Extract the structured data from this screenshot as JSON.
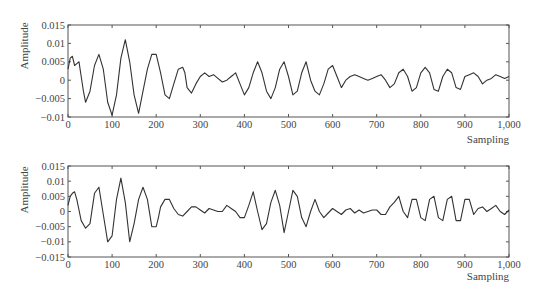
{
  "chart_data": [
    {
      "type": "line",
      "title": "",
      "xlabel": "Sampling",
      "ylabel": "Amplitude",
      "xlim": [
        0,
        1000
      ],
      "ylim": [
        -0.01,
        0.015
      ],
      "xticks": [
        "0",
        "100",
        "200",
        "300",
        "400",
        "500",
        "600",
        "700",
        "800",
        "900",
        "1,000"
      ],
      "yticks": [
        "0.015",
        "0.01",
        "0.005",
        "0",
        "-0.005",
        "-0.01"
      ],
      "grid": false,
      "series": [
        {
          "name": "signal-1",
          "x": [
            0,
            5,
            10,
            15,
            20,
            25,
            30,
            35,
            40,
            50,
            60,
            70,
            80,
            90,
            100,
            110,
            120,
            130,
            140,
            150,
            160,
            170,
            180,
            190,
            200,
            210,
            220,
            230,
            240,
            250,
            260,
            265,
            270,
            280,
            290,
            300,
            310,
            320,
            330,
            340,
            350,
            360,
            370,
            375,
            380,
            390,
            400,
            410,
            420,
            430,
            440,
            450,
            460,
            470,
            480,
            490,
            500,
            510,
            520,
            530,
            540,
            550,
            560,
            570,
            580,
            590,
            600,
            610,
            620,
            630,
            640,
            650,
            660,
            670,
            680,
            690,
            700,
            710,
            720,
            730,
            740,
            750,
            760,
            770,
            780,
            790,
            800,
            810,
            820,
            830,
            840,
            850,
            860,
            870,
            880,
            890,
            900,
            910,
            920,
            930,
            940,
            950,
            960,
            970,
            980,
            990,
            1000
          ],
          "y": [
            0.003,
            0.006,
            0.0065,
            0.004,
            0.0045,
            0.005,
            0.001,
            -0.003,
            -0.006,
            -0.003,
            0.004,
            0.007,
            0.003,
            -0.006,
            -0.0095,
            -0.004,
            0.006,
            0.011,
            0.005,
            -0.004,
            -0.009,
            -0.003,
            0.003,
            0.007,
            0.007,
            0.002,
            -0.004,
            -0.005,
            -0.001,
            0.003,
            0.0035,
            0.002,
            -0.002,
            -0.0035,
            -0.001,
            0.001,
            0.002,
            0.001,
            0.0015,
            0.0005,
            -0.0005,
            0.0,
            0.001,
            0.0015,
            0.002,
            -0.001,
            -0.004,
            -0.002,
            0.002,
            0.005,
            0.002,
            -0.003,
            -0.005,
            -0.002,
            0.003,
            0.005,
            0.001,
            -0.004,
            -0.003,
            0.002,
            0.005,
            0.0,
            -0.003,
            -0.004,
            -0.001,
            0.003,
            0.004,
            0.001,
            -0.002,
            0.0,
            0.001,
            0.0015,
            0.001,
            0.0005,
            0.0,
            0.0005,
            0.001,
            0.0015,
            0.0,
            -0.002,
            -0.001,
            0.002,
            0.003,
            0.001,
            -0.003,
            -0.002,
            0.002,
            0.0035,
            0.002,
            -0.0025,
            -0.003,
            0.001,
            0.003,
            0.002,
            -0.002,
            -0.0025,
            0.001,
            0.0015,
            0.002,
            0.001,
            -0.001,
            0.0,
            0.0005,
            0.0015,
            0.001,
            0.0005,
            0.001
          ]
        }
      ]
    },
    {
      "type": "line",
      "title": "",
      "xlabel": "Sampling",
      "ylabel": "Amplitude",
      "xlim": [
        0,
        1000
      ],
      "ylim": [
        -0.015,
        0.015
      ],
      "xticks": [
        "0",
        "100",
        "200",
        "300",
        "400",
        "500",
        "600",
        "700",
        "800",
        "900",
        "1,000"
      ],
      "yticks": [
        "0.015",
        "0.01",
        "0.005",
        "0",
        "-0.005",
        "-0.01",
        "-0.015"
      ],
      "grid": false,
      "series": [
        {
          "name": "signal-2",
          "x": [
            0,
            5,
            10,
            15,
            20,
            30,
            40,
            50,
            60,
            70,
            80,
            90,
            100,
            110,
            120,
            130,
            140,
            150,
            160,
            170,
            180,
            190,
            200,
            205,
            210,
            220,
            230,
            240,
            250,
            260,
            270,
            280,
            290,
            300,
            310,
            320,
            330,
            340,
            350,
            360,
            370,
            380,
            390,
            400,
            410,
            420,
            430,
            440,
            450,
            460,
            470,
            480,
            490,
            500,
            510,
            520,
            530,
            540,
            550,
            560,
            570,
            580,
            590,
            600,
            610,
            620,
            630,
            640,
            650,
            660,
            670,
            680,
            690,
            700,
            710,
            720,
            730,
            740,
            750,
            760,
            770,
            780,
            790,
            800,
            810,
            820,
            830,
            840,
            850,
            860,
            870,
            880,
            890,
            900,
            910,
            920,
            930,
            940,
            950,
            960,
            970,
            980,
            990,
            1000
          ],
          "y": [
            0.002,
            0.005,
            0.006,
            0.0065,
            0.004,
            -0.003,
            -0.0055,
            -0.004,
            0.006,
            0.008,
            -0.001,
            -0.01,
            -0.008,
            0.004,
            0.011,
            0.003,
            -0.01,
            -0.004,
            0.004,
            0.008,
            0.004,
            -0.005,
            -0.005,
            -0.002,
            0.0015,
            0.004,
            0.004,
            0.001,
            -0.001,
            -0.0015,
            0.0,
            0.0015,
            0.0015,
            0.0005,
            -0.0005,
            0.001,
            0.0005,
            0.0,
            0.0,
            0.002,
            0.001,
            0.0,
            -0.002,
            -0.002,
            0.002,
            0.0065,
            0.0,
            -0.006,
            -0.004,
            0.003,
            0.007,
            0.002,
            -0.007,
            0.0,
            0.007,
            0.005,
            -0.002,
            -0.005,
            0.0,
            0.004,
            0.0,
            -0.002,
            -0.0005,
            0.001,
            0.0,
            -0.001,
            0.0005,
            0.001,
            -0.0005,
            0.0005,
            -0.0005,
            0.0,
            0.0005,
            0.0005,
            -0.001,
            -0.001,
            0.0015,
            0.003,
            0.005,
            0.0,
            -0.002,
            0.004,
            0.004,
            -0.002,
            -0.003,
            0.004,
            0.005,
            -0.002,
            -0.003,
            0.004,
            0.005,
            -0.003,
            -0.003,
            0.004,
            0.004,
            -0.001,
            0.001,
            0.0015,
            0.0,
            0.001,
            0.002,
            0.0,
            -0.001,
            0.0005
          ]
        }
      ]
    }
  ],
  "plots": [
    {
      "xlabel": "Sampling",
      "ylabel": "Amplitude",
      "xticks": [
        "0",
        "100",
        "200",
        "300",
        "400",
        "500",
        "600",
        "700",
        "800",
        "900",
        "1,000"
      ],
      "yticks": [
        "0.015",
        "0.01",
        "0.005",
        "0",
        "-0.005",
        "-0.01"
      ]
    },
    {
      "xlabel": "Sampling",
      "ylabel": "Amplitude",
      "xticks": [
        "0",
        "100",
        "200",
        "300",
        "400",
        "500",
        "600",
        "700",
        "800",
        "900",
        "1,000"
      ],
      "yticks": [
        "0.015",
        "0.01",
        "0.005",
        "0",
        "-0.005",
        "-0.01",
        "-0.015"
      ]
    }
  ],
  "colors": {
    "line": "#333333",
    "axis": "#555555",
    "text": "#444444"
  }
}
